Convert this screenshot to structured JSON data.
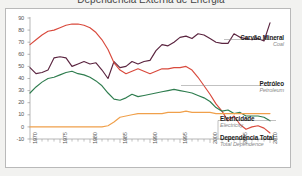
{
  "title": "Dependência Externa de Energia",
  "chart_frame": {
    "background": "#ffffff",
    "page_background": "#f2f2f0",
    "border_color": "#b9b9b9"
  },
  "axis": {
    "y_ticks": [
      "90",
      "80",
      "70",
      "60",
      "50",
      "40",
      "30",
      "20",
      "10",
      "0",
      "-10"
    ],
    "x_ticks": [
      "1970",
      "1975",
      "1980",
      "1985",
      "1990",
      "1995",
      "2000",
      "2005",
      "2010"
    ]
  },
  "legend": [
    {
      "pt": "Carvão Mineral",
      "en": "Coal",
      "color": "#5b2540"
    },
    {
      "pt": "Petróleo",
      "en": "Petroleum",
      "color": "#d94a3d"
    },
    {
      "pt": "Eletricidade",
      "en": "Electricity",
      "color": "#2f7d4f"
    },
    {
      "pt": "Dependência Total",
      "en": "Total Dependence",
      "color": "#f0a04b"
    }
  ],
  "chart_data": {
    "type": "line",
    "title": "Dependência Externa de Energia",
    "xlabel": "",
    "ylabel": "",
    "xlim": [
      1970,
      2011
    ],
    "ylim": [
      -10,
      90
    ],
    "grid": false,
    "legend_position": "right-inline",
    "x": [
      1970,
      1971,
      1972,
      1973,
      1974,
      1975,
      1976,
      1977,
      1978,
      1979,
      1980,
      1981,
      1982,
      1983,
      1984,
      1985,
      1986,
      1987,
      1988,
      1989,
      1990,
      1991,
      1992,
      1993,
      1994,
      1995,
      1996,
      1997,
      1998,
      1999,
      2000,
      2001,
      2002,
      2003,
      2004,
      2005,
      2006,
      2007,
      2008,
      2009,
      2010
    ],
    "series": [
      {
        "name": "Carvão Mineral",
        "name_en": "Coal",
        "color": "#5b2540",
        "values": [
          49,
          44,
          45,
          47,
          57,
          58,
          57,
          50,
          52,
          54,
          52,
          53,
          47,
          40,
          54,
          49,
          50,
          54,
          52,
          54,
          55,
          63,
          68,
          67,
          70,
          74,
          75,
          73,
          77,
          76,
          73,
          70,
          69,
          69,
          77,
          74,
          73,
          72,
          73,
          71,
          86
        ]
      },
      {
        "name": "Petróleo",
        "name_en": "Petroleum",
        "color": "#d94a3d",
        "values": [
          68,
          72,
          76,
          79,
          80,
          82,
          84,
          85,
          85,
          84,
          82,
          78,
          72,
          64,
          53,
          47,
          44,
          46,
          48,
          46,
          44,
          46,
          48,
          48,
          49,
          49,
          50,
          47,
          41,
          34,
          27,
          19,
          13,
          5,
          9,
          2,
          -2,
          0,
          1,
          -1,
          -5
        ]
      },
      {
        "name": "Eletricidade",
        "name_en": "Electricity",
        "color": "#2f7d4f",
        "values": [
          28,
          33,
          37,
          40,
          41,
          43,
          45,
          46,
          44,
          43,
          41,
          38,
          34,
          28,
          23,
          22,
          24,
          27,
          25,
          26,
          27,
          28,
          29,
          30,
          31,
          30,
          29,
          28,
          26,
          24,
          21,
          16,
          13,
          14,
          11,
          12,
          9,
          9,
          9,
          8,
          5
        ]
      },
      {
        "name": "Dependência Total",
        "name_en": "Total Dependence",
        "color": "#f0a04b",
        "values": [
          0,
          0,
          0,
          0,
          0,
          0,
          0,
          0,
          0,
          0,
          0,
          0,
          0,
          1,
          4,
          8,
          9,
          10,
          11,
          11,
          11,
          11,
          11,
          12,
          12,
          12,
          13,
          12,
          12,
          12,
          12,
          11,
          11,
          11,
          11,
          11,
          11,
          11,
          11,
          11,
          11
        ]
      }
    ]
  }
}
